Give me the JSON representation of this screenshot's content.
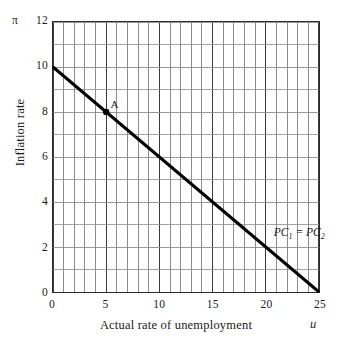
{
  "chart_data": {
    "type": "line",
    "title": "",
    "xlabel": "Actual rate of unemployment",
    "ylabel": "Inflation rate",
    "x_axis_symbol": "π",
    "y_axis_symbol": "π",
    "x_symbol": "u",
    "y_symbol": "π",
    "xlim": [
      0,
      25
    ],
    "ylim": [
      0,
      12
    ],
    "x_major_ticks": [
      0,
      5,
      10,
      15,
      20,
      25
    ],
    "y_major_ticks": [
      0,
      2,
      4,
      6,
      8,
      10,
      12
    ],
    "x_gridline_step": 1,
    "y_gridline_step": 1,
    "grid": true,
    "legend": "none",
    "series": [
      {
        "name": "PC1 = PC2",
        "label_text": "PC",
        "label_sub_1": "1",
        "label_sep": "=",
        "label_text_2": "PC",
        "label_sub_2": "2",
        "label_x": 20.6,
        "label_y": 2.75,
        "x": [
          0,
          25
        ],
        "values": [
          10,
          0
        ],
        "slope": -0.4,
        "intercept": 10,
        "color": "#000000",
        "width": 3
      }
    ],
    "annotations": [
      {
        "name": "A",
        "label": "A",
        "x": 5,
        "y": 8,
        "marker": "filled-circle",
        "marker_color": "#000000",
        "label_offset_x": 4,
        "label_offset_y": -14
      }
    ],
    "colors": {
      "axis": "#2b2b2b",
      "major_grid": "#3a3a3a",
      "minor_grid": "#8c8c8c",
      "line": "#000000",
      "background": "#ffffff",
      "text": "#1a1a1a"
    }
  },
  "axes": {
    "y_tick_labels": [
      "12",
      "10",
      "8",
      "6",
      "4",
      "2",
      "0"
    ],
    "x_tick_labels": [
      "0",
      "5",
      "10",
      "15",
      "20",
      "25"
    ],
    "y_title": "Inflation rate",
    "x_title": "Actual rate of unemployment",
    "y_symbol": "π",
    "x_symbol": "u"
  }
}
